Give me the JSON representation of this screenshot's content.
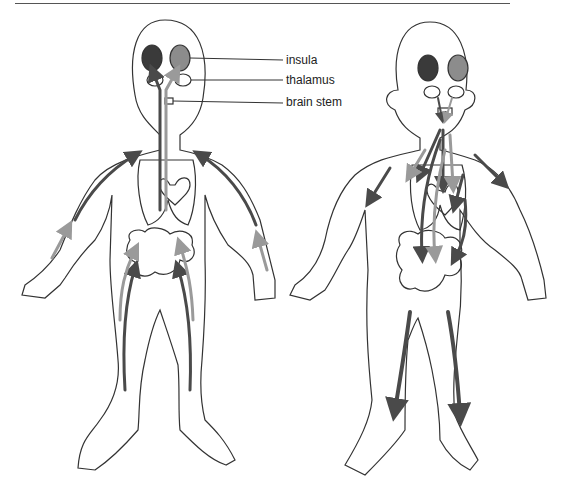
{
  "figure": {
    "labels": {
      "insula": "insula",
      "thalamus": "thalamus",
      "brain_stem": "brain stem"
    },
    "figures": [
      {
        "name": "left-figure",
        "flow_direction": "afferent (toward brain)"
      },
      {
        "name": "right-figure",
        "flow_direction": "efferent (from brain to body)"
      }
    ],
    "colors": {
      "outline": "#333333",
      "dark_arrow": "#4a4a4a",
      "light_arrow": "#9a9a9a",
      "dark_region": "#3a3a3a",
      "light_region": "#8c8c8c"
    }
  }
}
